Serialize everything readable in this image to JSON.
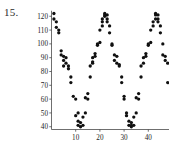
{
  "figure": {
    "problem_number": "15.",
    "background_color": "#ffffff",
    "point_color": "#101010",
    "axis_color": "#4a4a4a"
  },
  "chart_data": {
    "type": "scatter",
    "title": "",
    "xlabel": "",
    "ylabel": "",
    "xlim": [
      0,
      50
    ],
    "ylim": [
      36,
      124
    ],
    "grid": false,
    "legend": null,
    "xticks": [
      10,
      20,
      30,
      40
    ],
    "yticks": [
      40,
      50,
      60,
      70,
      80,
      90,
      100,
      110,
      120
    ],
    "xtick_labels": [
      "10",
      "20",
      "30",
      "40"
    ],
    "ytick_labels": [
      "40",
      "50",
      "60",
      "70",
      "80",
      "90",
      "100",
      "110",
      "120"
    ],
    "marker": "filled-circle",
    "series": [
      {
        "name": "series-1",
        "x": [
          1,
          1,
          2,
          2,
          3,
          3,
          4,
          4,
          5,
          5,
          5,
          6,
          6,
          7,
          7,
          8,
          8,
          9,
          10,
          10,
          11,
          11,
          11,
          12,
          12,
          13,
          13,
          14,
          14,
          15,
          15,
          16,
          16,
          17,
          17,
          17,
          18,
          18,
          19,
          19,
          20,
          20,
          21,
          21,
          21,
          22,
          22,
          22,
          23,
          23,
          23,
          24,
          24,
          25,
          25,
          26,
          26,
          27,
          27,
          28,
          28,
          29,
          29,
          30,
          30,
          31,
          31,
          32,
          32,
          33,
          33,
          33,
          34,
          34,
          35,
          35,
          36,
          36,
          37,
          37,
          38,
          38,
          39,
          39,
          40,
          40,
          41,
          41,
          42,
          42,
          43,
          43,
          43,
          44,
          44,
          44,
          45,
          45,
          46,
          46,
          47,
          47,
          48,
          48
        ],
        "y": [
          122,
          118,
          116,
          112,
          110,
          108,
          95,
          92,
          91,
          88,
          84,
          90,
          86,
          84,
          82,
          76,
          72,
          62,
          60,
          48,
          50,
          44,
          41,
          43,
          40,
          47,
          41,
          50,
          61,
          64,
          60,
          76,
          84,
          86,
          90,
          87,
          93,
          91,
          100,
          99,
          101,
          110,
          113,
          116,
          118,
          121,
          122,
          120,
          121,
          118,
          116,
          113,
          108,
          100,
          99,
          92,
          88,
          91,
          86,
          85,
          84,
          76,
          72,
          62,
          60,
          48,
          50,
          44,
          41,
          43,
          40,
          41,
          47,
          41,
          50,
          61,
          64,
          60,
          76,
          84,
          86,
          90,
          93,
          91,
          100,
          99,
          101,
          110,
          113,
          116,
          121,
          122,
          118,
          121,
          118,
          116,
          113,
          108,
          100,
          92,
          88,
          91,
          86,
          72
        ]
      }
    ]
  }
}
